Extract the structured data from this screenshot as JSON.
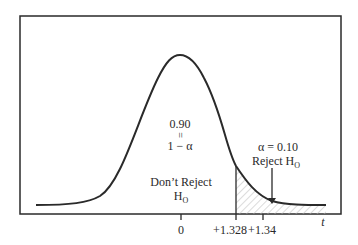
{
  "figure": {
    "type": "t-distribution one-tailed test diagram",
    "center_region": {
      "value_label": "0.90",
      "equals_symbol": "=",
      "expression_label": "1 − α",
      "decision_line1": "Don’t Reject",
      "decision_line2_main": "H",
      "decision_line2_sub": "O"
    },
    "rejection_region": {
      "alpha_label": "α = 0.10",
      "decision_main": "Reject H",
      "decision_sub": "O",
      "shading": "hatched"
    },
    "axis": {
      "variable_label": "t",
      "ticks": [
        {
          "label": "0"
        },
        {
          "label": "+1.328"
        },
        {
          "label": "+1.34"
        }
      ]
    },
    "colors": {
      "line": "#2a2a2a",
      "hatch": "#b8b8b8",
      "background": "#ffffff"
    }
  }
}
